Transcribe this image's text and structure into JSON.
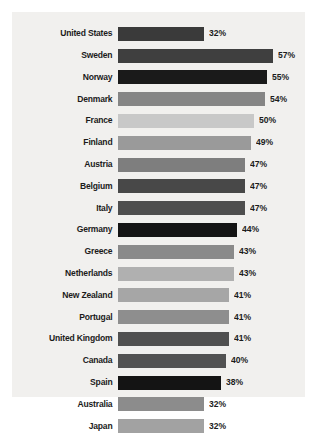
{
  "chart_data": {
    "type": "bar",
    "orientation": "horizontal",
    "title": "",
    "subtitle": "",
    "xlabel": "",
    "ylabel": "",
    "grid": false,
    "legend": "none",
    "value_suffix": "%",
    "xlim": [
      0,
      57
    ],
    "categories": [
      "United States",
      "Sweden",
      "Norway",
      "Denmark",
      "France",
      "Finland",
      "Austria",
      "Belgium",
      "Italy",
      "Germany",
      "Greece",
      "Netherlands",
      "New Zealand",
      "Portugal",
      "United Kingdom",
      "Canada",
      "Spain",
      "Australia",
      "Japan"
    ],
    "values": [
      32,
      57,
      55,
      54,
      50,
      49,
      47,
      47,
      47,
      44,
      43,
      43,
      41,
      41,
      41,
      40,
      38,
      32,
      32
    ],
    "value_labels": [
      "32%",
      "57%",
      "55%",
      "54%",
      "50%",
      "49%",
      "47%",
      "47%",
      "47%",
      "44%",
      "43%",
      "43%",
      "41%",
      "41%",
      "41%",
      "40%",
      "38%",
      "32%",
      "32%"
    ],
    "bar_colors": [
      "#3a3a3a",
      "#3f3f3f",
      "#1a1a1a",
      "#858585",
      "#c8c8c8",
      "#9a9a9a",
      "#7e7e7e",
      "#484848",
      "#4e4e4e",
      "#141414",
      "#8a8a8a",
      "#b0b0b0",
      "#a6a6a6",
      "#8e8e8e",
      "#505050",
      "#525252",
      "#141414",
      "#8c8c8c",
      "#a2a2a2"
    ]
  },
  "style": {
    "panel_background": "#f1f0ee",
    "page_background": "#ffffff",
    "text_color": "#1b1b1b"
  }
}
